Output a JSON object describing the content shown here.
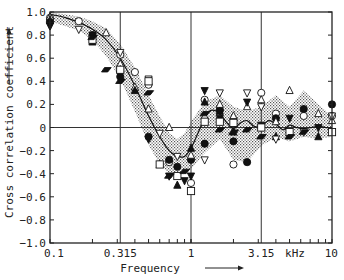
{
  "chart_data": {
    "type": "scatter",
    "title": "",
    "xlabel": "Frequency",
    "ylabel": "Cross correlation coefficient",
    "x_unit": "kHz",
    "x_scale": "log",
    "xlim": [
      0.1,
      10
    ],
    "ylim": [
      -1.0,
      1.0
    ],
    "x_ticks": [
      {
        "value": 0.1,
        "label": "0.1"
      },
      {
        "value": 0.315,
        "label": "0.315"
      },
      {
        "value": 1,
        "label": "1"
      },
      {
        "value": 3.15,
        "label": "3.15"
      },
      {
        "value": 10,
        "label": "10"
      }
    ],
    "y_ticks": [
      {
        "value": 1.0,
        "label": "1.0"
      },
      {
        "value": 0.8,
        "label": "0.8"
      },
      {
        "value": 0.6,
        "label": "0.6"
      },
      {
        "value": 0.4,
        "label": "0.4"
      },
      {
        "value": 0.2,
        "label": "0.2"
      },
      {
        "value": 0,
        "label": "0"
      },
      {
        "value": -0.2,
        "label": "−0.2"
      },
      {
        "value": -0.4,
        "label": "−0.4"
      },
      {
        "value": -0.6,
        "label": "−0.6"
      },
      {
        "value": -0.8,
        "label": "−0.8"
      },
      {
        "value": -1.0,
        "label": "−1.0"
      }
    ],
    "grid": {
      "vertical_at": [
        0.315,
        1,
        3.15
      ],
      "horizontal_at": [
        0
      ]
    },
    "legend": "none",
    "curve": {
      "name": "mean",
      "x": [
        0.1,
        0.13,
        0.16,
        0.2,
        0.25,
        0.315,
        0.4,
        0.5,
        0.6,
        0.7,
        0.8,
        0.9,
        1.0,
        1.12,
        1.25,
        1.4,
        1.6,
        1.8,
        2.0,
        2.24,
        2.5,
        2.8,
        3.15,
        3.55,
        4.0,
        4.5,
        5.0,
        5.6,
        6.3,
        7.1,
        8.0,
        9.0,
        10
      ],
      "y": [
        0.98,
        0.95,
        0.91,
        0.85,
        0.76,
        0.6,
        0.36,
        0.1,
        -0.08,
        -0.2,
        -0.25,
        -0.25,
        -0.18,
        -0.05,
        0.08,
        0.15,
        0.12,
        0.04,
        -0.01,
        0.04,
        0.06,
        0.01,
        0.01,
        0.06,
        0.03,
        -0.02,
        0.02,
        0.0,
        -0.01,
        0.0,
        0.01,
        0.0,
        0.0
      ]
    },
    "band": {
      "name": "spread (stippled)",
      "x": [
        0.1,
        0.16,
        0.2,
        0.25,
        0.315,
        0.4,
        0.5,
        0.6,
        0.7,
        0.8,
        0.9,
        1.0,
        1.25,
        1.6,
        2.0,
        2.5,
        3.15,
        4.0,
        5.0,
        6.3,
        8.0,
        10
      ],
      "upper": [
        1.0,
        0.96,
        0.92,
        0.86,
        0.72,
        0.52,
        0.28,
        0.1,
        -0.05,
        -0.1,
        -0.05,
        0.05,
        0.22,
        0.28,
        0.18,
        0.14,
        0.18,
        0.28,
        0.18,
        0.32,
        0.2,
        0.1
      ],
      "lower": [
        0.92,
        0.84,
        0.76,
        0.62,
        0.42,
        0.14,
        -0.15,
        -0.32,
        -0.4,
        -0.42,
        -0.4,
        -0.36,
        -0.22,
        -0.1,
        -0.28,
        -0.3,
        -0.16,
        -0.08,
        -0.12,
        -0.08,
        -0.1,
        -0.08
      ]
    },
    "series": [
      {
        "name": "open-circle",
        "marker": "circle-open",
        "x": [
          0.1,
          0.16,
          0.315,
          0.4,
          0.5,
          0.7,
          1.0,
          1.25,
          1.6,
          2.0,
          3.15,
          4.0,
          6.3,
          10
        ],
        "y": [
          0.95,
          0.92,
          0.63,
          0.48,
          0.37,
          -0.3,
          -0.48,
          0.24,
          0.15,
          -0.32,
          0.3,
          0.12,
          0.1,
          0.1
        ]
      },
      {
        "name": "filled-circle",
        "marker": "circle-filled",
        "x": [
          0.1,
          0.2,
          0.315,
          0.5,
          0.7,
          0.8,
          1.0,
          1.25,
          1.6,
          2.0,
          2.5,
          4.0,
          6.3,
          10
        ],
        "y": [
          0.92,
          0.8,
          0.44,
          -0.08,
          -0.28,
          -0.34,
          -0.28,
          -0.14,
          0.15,
          -0.12,
          -0.3,
          0.08,
          0.16,
          0.2
        ]
      },
      {
        "name": "open-triangle-up",
        "marker": "triangle-up-open",
        "x": [
          0.1,
          0.25,
          0.315,
          0.4,
          0.5,
          0.7,
          1.0,
          1.25,
          1.6,
          2.0,
          2.5,
          3.15,
          4.0,
          5.0,
          8.0,
          10
        ],
        "y": [
          0.96,
          0.82,
          0.55,
          0.35,
          0.16,
          0.0,
          -0.24,
          0.1,
          0.2,
          0.1,
          0.18,
          0.24,
          0.05,
          0.32,
          0.12,
          0.06
        ]
      },
      {
        "name": "filled-triangle-up",
        "marker": "triangle-up-filled",
        "x": [
          0.1,
          0.2,
          0.315,
          0.4,
          0.6,
          0.8,
          1.0,
          1.25,
          1.6,
          2.0,
          4.0,
          8.0
        ],
        "y": [
          0.93,
          0.74,
          0.5,
          0.32,
          -0.32,
          -0.5,
          -0.18,
          0.22,
          0.14,
          -0.04,
          -0.08,
          -0.08
        ]
      },
      {
        "name": "open-triangle-down",
        "marker": "triangle-down-open",
        "x": [
          0.1,
          0.16,
          0.315,
          0.5,
          0.6,
          0.8,
          1.25,
          1.6,
          2.0,
          2.5,
          3.15,
          4.0,
          6.3,
          10
        ],
        "y": [
          0.88,
          0.85,
          0.65,
          0.42,
          -0.05,
          -0.25,
          -0.28,
          0.3,
          0.05,
          0.3,
          0.18,
          -0.1,
          -0.04,
          0.1
        ]
      },
      {
        "name": "filled-triangle-down",
        "marker": "triangle-down-filled",
        "x": [
          0.1,
          0.2,
          0.315,
          0.5,
          0.7,
          0.9,
          1.0,
          1.25,
          1.6,
          2.5,
          3.15,
          5.0,
          8.0
        ],
        "y": [
          0.88,
          0.8,
          0.46,
          -0.1,
          -0.42,
          -0.46,
          -0.42,
          0.32,
          0.08,
          0.22,
          0.02,
          0.08,
          0.0
        ]
      },
      {
        "name": "open-square",
        "marker": "square-open",
        "x": [
          0.2,
          0.315,
          0.5,
          0.6,
          0.8,
          1.0,
          1.25,
          1.6,
          2.0,
          3.15,
          5.0,
          10
        ],
        "y": [
          0.76,
          0.5,
          0.4,
          -0.32,
          -0.42,
          -0.55,
          0.05,
          0.05,
          0.04,
          0.0,
          -0.04,
          -0.04
        ]
      },
      {
        "name": "filled-parallelogram",
        "marker": "parallelogram-filled",
        "x": [
          0.2,
          0.25,
          0.315,
          0.5,
          0.7,
          0.9,
          1.25,
          1.6,
          2.0,
          2.5,
          3.15,
          5.0,
          6.3
        ],
        "y": [
          0.78,
          0.5,
          0.4,
          0.3,
          -0.42,
          -0.38,
          0.12,
          -0.02,
          -0.04,
          -0.02,
          -0.08,
          -0.08,
          -0.04
        ]
      }
    ]
  }
}
